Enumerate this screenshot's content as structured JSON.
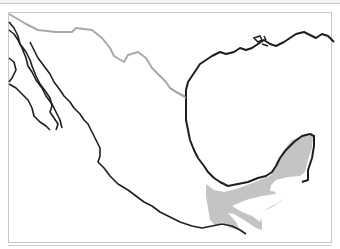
{
  "map": {
    "subject": "Mexico",
    "layers": [
      {
        "name": "coastline",
        "color": "#1e1e1e"
      },
      {
        "name": "us-mexico-border",
        "color": "#a8a8a8"
      },
      {
        "name": "range-shading",
        "color": "#c4c4c4",
        "region": "Yucatán Peninsula and Isthmus of Tehuantepec"
      }
    ],
    "colors": {
      "background": "#ffffff",
      "frame": "#c9c9c9",
      "coast": "#1e1e1e",
      "border": "#a8a8a8",
      "range_fill": "#c4c4c4"
    }
  }
}
